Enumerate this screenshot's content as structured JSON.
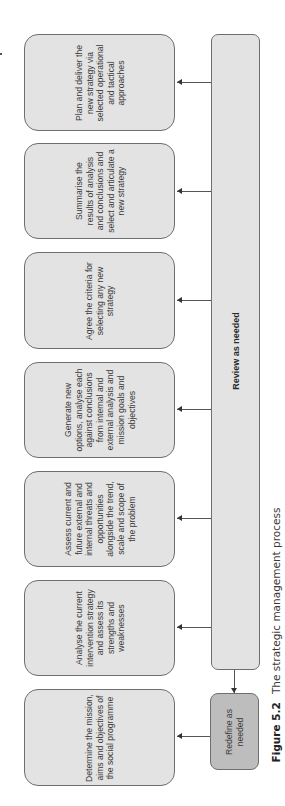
{
  "diagram": {
    "title": "The strategic management process",
    "figure_label": "Figure 5.2",
    "steps": [
      {
        "id": "plan",
        "text": "Plan and deliver the new strategy via selected operational and tactical approaches"
      },
      {
        "id": "summarise",
        "text": "Summarise the results of analysis and conclusions and select and articulate a new strategy"
      },
      {
        "id": "agree",
        "text": "Agree the criteria for selecting any new strategy"
      },
      {
        "id": "generate",
        "text": "Generate new options, analyse each against conclusions from internal and external analysis and mission goals and objectives"
      },
      {
        "id": "assess",
        "text": "Assess current and future external and internal threats and opportunities alongside the trend, scale and scope of the problem"
      },
      {
        "id": "analyse",
        "text": "Analyse the current intervention strategy and assess its strengths and weaknesses"
      },
      {
        "id": "determine",
        "text": "Determine the mission, aims and objectives of the social programme"
      }
    ],
    "review_bar": {
      "text": "Review as needed"
    },
    "redefine_box": {
      "text": "Redefine as needed"
    },
    "colors": {
      "box_fill": "#e3e3e3",
      "redefine_fill": "#bdbdbd",
      "border": "#6e6e6e",
      "arrow": "#555555"
    }
  }
}
